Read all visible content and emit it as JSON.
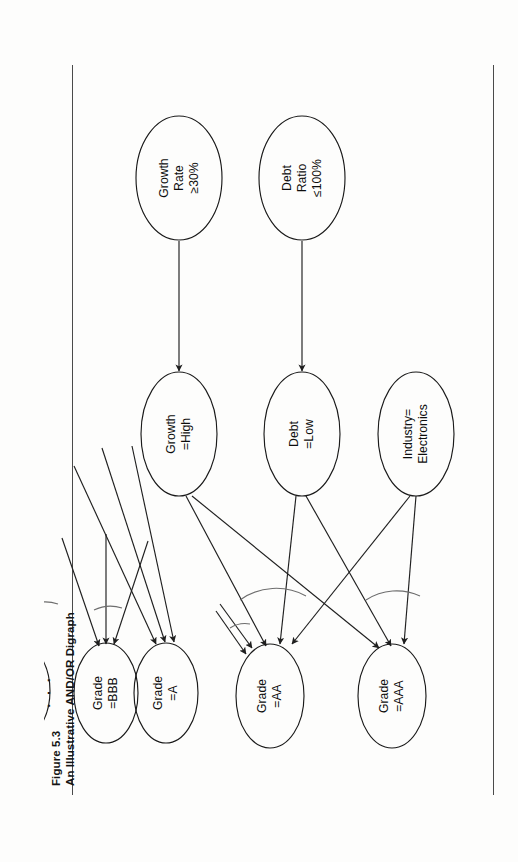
{
  "figure": {
    "number_label": "Figure 5.3",
    "title": "An Illustrative AND/OR Digraph",
    "orientation": "rotated-90-ccw",
    "ellipsis": "· · ·"
  },
  "colors": {
    "paper": "#fdfdfc",
    "ink": "#1a1a1a",
    "rule": "#4a4a4a",
    "arc": "#6d6d6d"
  },
  "nodes": [
    {
      "id": "grade_aaa",
      "lines": [
        "Grade",
        "=AAA"
      ]
    },
    {
      "id": "grade_aa",
      "lines": [
        "Grade",
        "=AA"
      ]
    },
    {
      "id": "grade_a",
      "lines": [
        "Grade",
        "=A"
      ]
    },
    {
      "id": "grade_bbb",
      "lines": [
        "Grade",
        "=BBB"
      ]
    },
    {
      "id": "grade_d",
      "lines": [
        "Grade",
        "=D"
      ]
    },
    {
      "id": "industry",
      "lines": [
        "Industry=",
        "Electronics"
      ]
    },
    {
      "id": "debt_low",
      "lines": [
        "Debt",
        "=Low"
      ]
    },
    {
      "id": "growth_high",
      "lines": [
        "Growth",
        "=High"
      ]
    },
    {
      "id": "debt_ratio",
      "lines": [
        "Debt",
        "Ratio",
        "≤100%"
      ]
    },
    {
      "id": "growth_rate",
      "lines": [
        "Growth",
        "Rate",
        "≥30%"
      ]
    }
  ],
  "edges": [
    {
      "from": "industry",
      "to": "grade_aaa"
    },
    {
      "from": "debt_low",
      "to": "grade_aaa"
    },
    {
      "from": "growth_high",
      "to": "grade_aaa"
    },
    {
      "from": "industry",
      "to": "grade_aa"
    },
    {
      "from": "debt_low",
      "to": "grade_aa"
    },
    {
      "from": "growth_high",
      "to": "grade_aa"
    },
    {
      "from": "debt_ratio",
      "to": "debt_low"
    },
    {
      "from": "growth_rate",
      "to": "growth_high"
    }
  ],
  "rules": {
    "top_label": "page-rule-top",
    "bottom_label": "page-rule-bottom"
  }
}
